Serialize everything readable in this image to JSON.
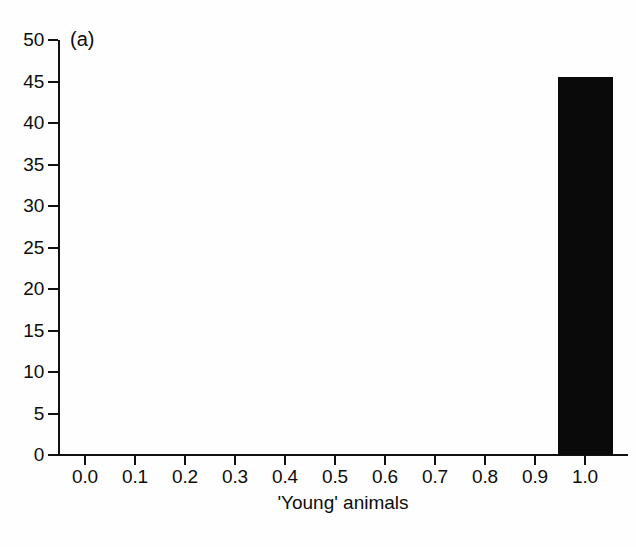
{
  "figure": {
    "panel_label": "(a)",
    "background_color": "#fefefe",
    "ink_color": "#0a0a0a"
  },
  "chart_data": {
    "type": "bar",
    "title": "",
    "subtitle": "",
    "panel": "(a)",
    "xlabel": "'Young' animals",
    "ylabel": "",
    "xlim": [
      -0.04,
      1.08
    ],
    "ylim": [
      0,
      50
    ],
    "grid": false,
    "legend": null,
    "x_tick_labels": [
      "0.0",
      "0.1",
      "0.2",
      "0.3",
      "0.4",
      "0.5",
      "0.6",
      "0.7",
      "0.8",
      "0.9",
      "1.0"
    ],
    "x_tick_values": [
      0.0,
      0.1,
      0.2,
      0.3,
      0.4,
      0.5,
      0.6,
      0.7,
      0.8,
      0.9,
      1.0
    ],
    "y_tick_labels": [
      "0",
      "5",
      "10",
      "15",
      "20",
      "25",
      "30",
      "35",
      "40",
      "45",
      "50"
    ],
    "y_tick_values": [
      0,
      5,
      10,
      15,
      20,
      25,
      30,
      35,
      40,
      45,
      50
    ],
    "bars": [
      {
        "label": "1.0",
        "bin_start": 0.945,
        "bin_end": 1.055,
        "value": 45.5
      }
    ],
    "categories": [
      "1.0"
    ],
    "values": [
      45.5
    ]
  }
}
